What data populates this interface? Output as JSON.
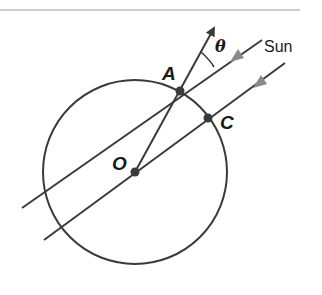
{
  "diagram": {
    "labels": {
      "point_a": "A",
      "point_c": "C",
      "point_o": "O",
      "angle": "θ",
      "sun": "Sun"
    },
    "colors": {
      "stroke": "#3a3a3a",
      "arrow_gray": "#8a8a8a",
      "rule": "#9a9a9a"
    }
  }
}
